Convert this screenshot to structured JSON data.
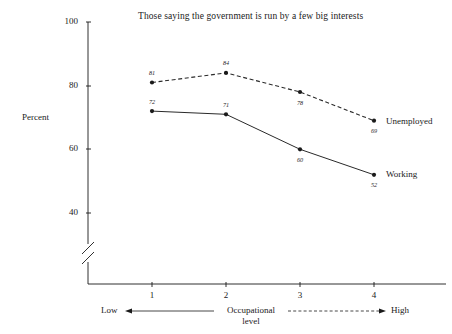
{
  "chart_data": {
    "type": "line",
    "title": "Those saying the government is run by a few big interests",
    "xlabel": "Occupational level",
    "ylabel": "Percent",
    "x": [
      1,
      2,
      3,
      4
    ],
    "categories": [
      "1",
      "2",
      "3",
      "4"
    ],
    "ylim": [
      40,
      100
    ],
    "yticks": [
      40,
      60,
      80,
      100
    ],
    "ytick_labels": [
      "40",
      "60",
      "80",
      "100"
    ],
    "xtick_labels": [
      "1",
      "2",
      "3",
      "4"
    ],
    "axis_break": true,
    "grid": false,
    "legend_position": "right-inline",
    "series": [
      {
        "name": "Unemployed",
        "style": "dashed",
        "values": [
          81,
          84,
          78,
          69
        ],
        "point_labels": [
          "81",
          "84",
          "78",
          "69"
        ],
        "label_positions": [
          "above",
          "above",
          "below",
          "below"
        ]
      },
      {
        "name": "Working",
        "style": "solid",
        "values": [
          72,
          71,
          60,
          52
        ],
        "point_labels": [
          "72",
          "71",
          "60",
          "52"
        ],
        "label_positions": [
          "above",
          "above",
          "below",
          "below"
        ]
      }
    ],
    "annotations": {
      "axis_low": "Low",
      "axis_high": "High",
      "axis_center_line1": "Occupational",
      "axis_center_line2": "level"
    }
  },
  "colors": {
    "ink": "#1a1a1a",
    "line": "#2a2a2a",
    "background": "#ffffff"
  }
}
